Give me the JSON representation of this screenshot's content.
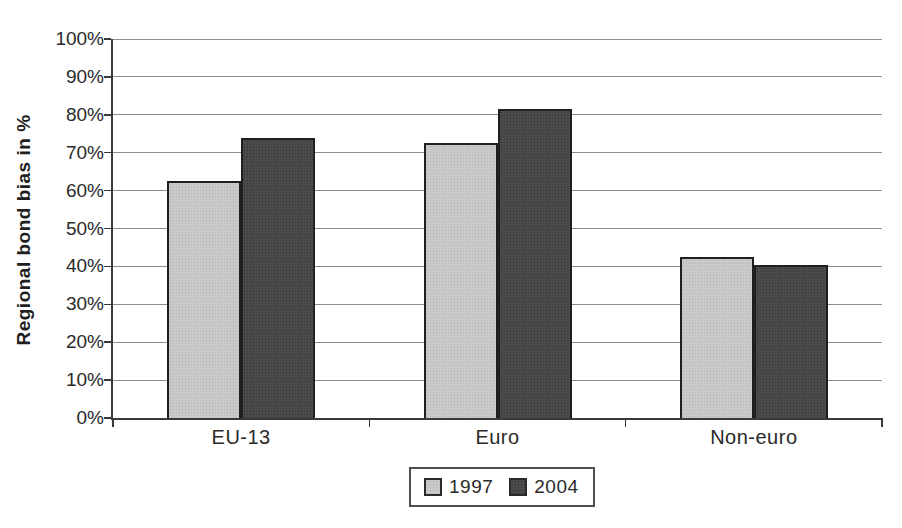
{
  "chart_data": {
    "type": "bar",
    "title": "",
    "xlabel": "",
    "ylabel": "Regional bond bias in %",
    "categories": [
      "EU-13",
      "Euro",
      "Non-euro"
    ],
    "series": [
      {
        "name": "1997",
        "color": "#c9c9c9",
        "values": [
          62.5,
          72.5,
          42.5
        ]
      },
      {
        "name": "2004",
        "color": "#4a4a4a",
        "values": [
          74,
          81.5,
          40.5
        ]
      }
    ],
    "ylim": [
      0,
      100
    ],
    "ytick_step": 10,
    "ytick_labels": [
      "0%",
      "10%",
      "20%",
      "30%",
      "40%",
      "50%",
      "60%",
      "70%",
      "80%",
      "90%",
      "100%"
    ],
    "grid": "horizontal-gridlines",
    "legend": {
      "position": "bottom",
      "items": [
        "1997",
        "2004"
      ]
    },
    "colors": {
      "gridline": "#8c8c8c",
      "axis": "#3a3a3a",
      "bar_border": "#1f1f1f",
      "text": "#262626"
    }
  }
}
